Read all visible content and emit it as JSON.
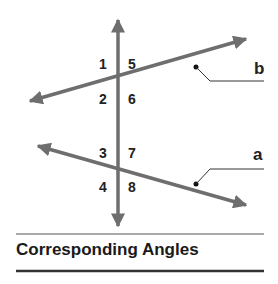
{
  "title": "Corresponding Angles",
  "lines": {
    "a": {
      "label": "a"
    },
    "b": {
      "label": "b"
    }
  },
  "angles": [
    {
      "label": "1",
      "x": 101,
      "y": 69
    },
    {
      "label": "5",
      "x": 131,
      "y": 69
    },
    {
      "label": "2",
      "x": 101,
      "y": 104
    },
    {
      "label": "6",
      "x": 131,
      "y": 104
    },
    {
      "label": "3",
      "x": 101,
      "y": 158
    },
    {
      "label": "7",
      "x": 131,
      "y": 158
    },
    {
      "label": "4",
      "x": 101,
      "y": 192
    },
    {
      "label": "8",
      "x": 131,
      "y": 192
    }
  ],
  "colors": {
    "line": "#6e6e6e",
    "text": "#222222",
    "rule": "#555555"
  }
}
